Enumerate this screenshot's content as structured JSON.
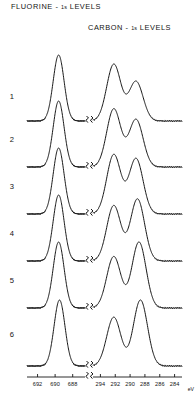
{
  "figure": {
    "titles": {
      "fluorine": {
        "element": "FLUORINE",
        "dash": "-",
        "orbital": "1s",
        "levels": "LEVELS"
      },
      "carbon": {
        "element": "CARBON",
        "dash": "-",
        "orbital": "1s",
        "levels": "LEVELS"
      }
    },
    "axis_unit": "eV",
    "row_labels": [
      "1",
      "2",
      "3",
      "4",
      "5",
      "6"
    ],
    "fluorine_ticks": [
      "692",
      "690",
      "688"
    ],
    "carbon_ticks": [
      "294",
      "292",
      "290",
      "288",
      "286",
      "284"
    ],
    "ink_color": "#161616",
    "background_color": "#ffffff"
  },
  "chart_data": {
    "type": "line",
    "xlabel": "eV",
    "ylabel": "",
    "grid": false,
    "legend": "none",
    "panels": [
      {
        "name": "fluorine-1s",
        "xlabel": "eV",
        "tick_values": [
          692,
          690,
          688
        ],
        "xlim": [
          693.2,
          686.6
        ],
        "axis_direction": "decreasing-right"
      },
      {
        "name": "carbon-1s",
        "xlabel": "eV",
        "tick_values": [
          294,
          292,
          290,
          288,
          286,
          284
        ],
        "xlim": [
          295.0,
          283.0
        ],
        "axis_direction": "decreasing-right"
      }
    ],
    "series": [
      {
        "name": "1",
        "fluorine_peaks": [
          {
            "x": 689.6,
            "height": 1.0
          }
        ],
        "carbon_peaks": [
          {
            "x": 292.2,
            "height": 0.86
          },
          {
            "x": 289.2,
            "height": 0.6
          }
        ]
      },
      {
        "name": "2",
        "fluorine_peaks": [
          {
            "x": 689.6,
            "height": 1.0
          }
        ],
        "carbon_peaks": [
          {
            "x": 292.2,
            "height": 0.88
          },
          {
            "x": 289.2,
            "height": 0.72
          }
        ]
      },
      {
        "name": "3",
        "fluorine_peaks": [
          {
            "x": 689.6,
            "height": 1.0
          }
        ],
        "carbon_peaks": [
          {
            "x": 292.2,
            "height": 0.9
          },
          {
            "x": 289.2,
            "height": 0.84
          }
        ]
      },
      {
        "name": "4",
        "fluorine_peaks": [
          {
            "x": 689.6,
            "height": 1.0
          }
        ],
        "carbon_peaks": [
          {
            "x": 292.2,
            "height": 0.84
          },
          {
            "x": 289.0,
            "height": 0.94
          }
        ]
      },
      {
        "name": "5",
        "fluorine_peaks": [
          {
            "x": 689.6,
            "height": 1.0
          }
        ],
        "carbon_peaks": [
          {
            "x": 292.2,
            "height": 0.78
          },
          {
            "x": 288.8,
            "height": 1.0
          }
        ]
      },
      {
        "name": "6",
        "fluorine_peaks": [
          {
            "x": 689.5,
            "height": 1.0
          }
        ],
        "carbon_peaks": [
          {
            "x": 292.2,
            "height": 0.74
          },
          {
            "x": 288.6,
            "height": 1.0
          }
        ]
      }
    ]
  }
}
